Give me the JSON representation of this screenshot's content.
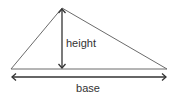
{
  "diagram": {
    "labels": {
      "height": "height",
      "base": "base"
    },
    "colors": {
      "stroke": "#666666",
      "text": "#333333",
      "background": "#ffffff"
    },
    "shape": {
      "apex": [
        62,
        8
      ],
      "base_left": [
        11,
        69
      ],
      "base_right": [
        167,
        69
      ]
    }
  }
}
